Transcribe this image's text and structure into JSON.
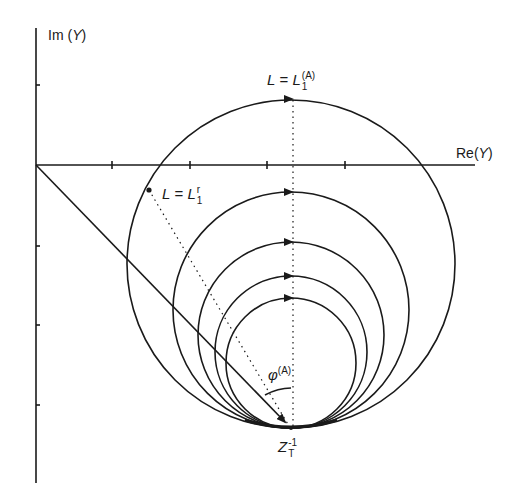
{
  "figure": {
    "type": "admittance circle diagram",
    "stroke_color": "#1a1a1a",
    "background": "#ffffff"
  },
  "axes": {
    "imag_label": {
      "prefix": "Im",
      "var": "Y"
    },
    "real_label": {
      "prefix": "Re",
      "var": "Y"
    },
    "origin": [
      36,
      165
    ],
    "real_axis_end": 475,
    "imag_axis_top": 28,
    "imag_axis_bottom": 483,
    "real_ticks_x": [
      112,
      190,
      267,
      345
    ],
    "imag_ticks_y": [
      85,
      246,
      325,
      405
    ]
  },
  "labels": {
    "top_point": {
      "lhs": "L",
      "eq": "=",
      "rhs": "L",
      "sub": "1",
      "sup": "(A)"
    },
    "resonance_point": {
      "lhs": "L",
      "eq": "=",
      "rhs": "L",
      "sub": "1",
      "sup": "r"
    },
    "angle": {
      "symbol": "φ",
      "sup": "(A)"
    },
    "tangent_point": {
      "base": "Z",
      "sup": "-1",
      "sub": "T"
    }
  },
  "circles": {
    "tangent_point": [
      291,
      428
    ],
    "center_x": 291,
    "radii": [
      164,
      118,
      93,
      76,
      65
    ]
  },
  "points": {
    "top": [
      291,
      98
    ],
    "resonance": [
      149,
      190
    ]
  }
}
